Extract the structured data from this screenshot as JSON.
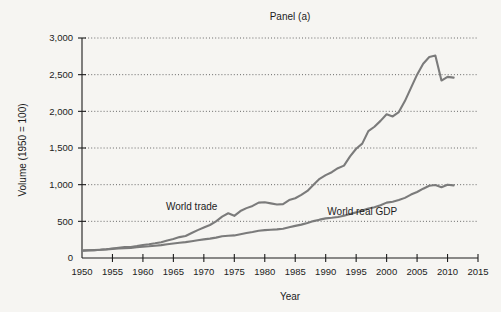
{
  "chart_data": {
    "type": "line",
    "title": "Panel (a)",
    "xlabel": "Year",
    "ylabel": "Volume (1950 = 100)",
    "xlim": [
      1950,
      2015
    ],
    "ylim": [
      0,
      3000
    ],
    "xticks": [
      1950,
      1955,
      1960,
      1965,
      1970,
      1975,
      1980,
      1985,
      1990,
      1995,
      2000,
      2005,
      2010,
      2015
    ],
    "xtick_labels": [
      "1950",
      "1955",
      "1960",
      "1965",
      "1970",
      "1975",
      "1980",
      "1985",
      "1990",
      "1995",
      "2000",
      "2005",
      "2010",
      "2015"
    ],
    "yticks": [
      0,
      500,
      1000,
      1500,
      2000,
      2500,
      3000
    ],
    "ytick_labels": [
      "0",
      "500",
      "1,000",
      "1,500",
      "2,000",
      "2,500",
      "3,000"
    ],
    "grid": "horizontal-dotted",
    "legend_position": "inline-annotation",
    "series": [
      {
        "name": "World trade",
        "color": "#7b7b7b",
        "label_x": 1968,
        "label_y": 660,
        "x": [
          1950,
          1951,
          1952,
          1953,
          1954,
          1955,
          1956,
          1957,
          1958,
          1959,
          1960,
          1961,
          1962,
          1963,
          1964,
          1965,
          1966,
          1967,
          1968,
          1969,
          1970,
          1971,
          1972,
          1973,
          1974,
          1975,
          1976,
          1977,
          1978,
          1979,
          1980,
          1981,
          1982,
          1983,
          1984,
          1985,
          1986,
          1987,
          1988,
          1989,
          1990,
          1991,
          1992,
          1993,
          1994,
          1995,
          1996,
          1997,
          1998,
          1999,
          2000,
          2001,
          2002,
          2003,
          2004,
          2005,
          2006,
          2007,
          2008,
          2009,
          2010,
          2011
        ],
        "values": [
          100,
          106,
          107,
          112,
          120,
          130,
          140,
          148,
          148,
          162,
          178,
          188,
          200,
          215,
          240,
          260,
          285,
          300,
          340,
          380,
          415,
          450,
          500,
          565,
          610,
          575,
          640,
          680,
          710,
          755,
          760,
          745,
          730,
          735,
          790,
          815,
          860,
          915,
          1000,
          1080,
          1130,
          1170,
          1225,
          1260,
          1385,
          1490,
          1560,
          1730,
          1790,
          1870,
          1960,
          1930,
          1990,
          2140,
          2320,
          2500,
          2650,
          2740,
          2760,
          2420,
          2470,
          2460
        ]
      },
      {
        "name": "World real GDP",
        "color": "#7b7b7b",
        "label_x": 1996,
        "label_y": 585,
        "x": [
          1950,
          1951,
          1952,
          1953,
          1954,
          1955,
          1956,
          1957,
          1958,
          1959,
          1960,
          1961,
          1962,
          1963,
          1964,
          1965,
          1966,
          1967,
          1968,
          1969,
          1970,
          1971,
          1972,
          1973,
          1974,
          1975,
          1976,
          1977,
          1978,
          1979,
          1980,
          1981,
          1982,
          1983,
          1984,
          1985,
          1986,
          1987,
          1988,
          1989,
          1990,
          1991,
          1992,
          1993,
          1994,
          1995,
          1996,
          1997,
          1998,
          1999,
          2000,
          2001,
          2002,
          2003,
          2004,
          2005,
          2006,
          2007,
          2008,
          2009,
          2010,
          2011
        ],
        "values": [
          100,
          104,
          108,
          113,
          117,
          124,
          130,
          135,
          138,
          146,
          154,
          160,
          168,
          176,
          187,
          197,
          208,
          216,
          229,
          243,
          254,
          264,
          278,
          296,
          303,
          308,
          325,
          340,
          355,
          372,
          380,
          386,
          390,
          400,
          420,
          438,
          455,
          478,
          503,
          523,
          540,
          548,
          560,
          575,
          600,
          622,
          648,
          675,
          692,
          720,
          755,
          768,
          790,
          820,
          865,
          900,
          945,
          985,
          995,
          965,
          1000,
          990
        ]
      }
    ]
  }
}
